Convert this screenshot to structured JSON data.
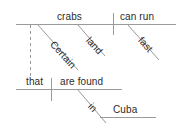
{
  "diagram": {
    "type": "reed-kellogg-sentence-diagram",
    "sentence": "Certain crabs that are found in Cuba can run fast on land.",
    "colors": {
      "line": "#9a9a9a",
      "text": "#2b2b2b",
      "background": "#ffffff"
    },
    "words": {
      "subject": "crabs",
      "predicate": "can run",
      "subject_modifier": "Certain",
      "predicate_modifier_place": "land",
      "predicate_modifier_manner": "fast",
      "relative_pronoun": "that",
      "relative_verb": "are found",
      "relative_preposition": "in",
      "relative_object": "Cuba"
    },
    "lines": {
      "main_baseline": "horizontal rule carrying subject and predicate",
      "subject_predicate_divider": "vertical rule between crabs and can run",
      "relative_clause_connector": "dashed vertical rule from crabs down to that",
      "relative_baseline": "horizontal rule carrying that and are found",
      "prepositional_baseline": "horizontal rule carrying Cuba"
    }
  }
}
